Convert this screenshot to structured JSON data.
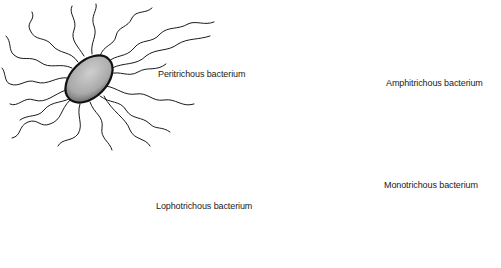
{
  "figure": {
    "background": "#ffffff",
    "ink_color": "#1a1a1a",
    "cell_fill": "#b8b8b8",
    "panels": [
      {
        "id": "peritrichous",
        "label": "Peritrichous bacterium",
        "flagella_arrangement": "flagella distributed over entire cell surface"
      },
      {
        "id": "amphitrichous",
        "label": "Amphitrichous bacterium",
        "flagella_arrangement": "single flagellum at each end"
      },
      {
        "id": "lophotrichous",
        "label": "Lophotrichous bacterium",
        "flagella_arrangement": "tuft of flagella at one end"
      },
      {
        "id": "monotrichous",
        "label": "Monotrichous bacterium",
        "flagella_arrangement": "single flagellum at one end"
      }
    ]
  }
}
